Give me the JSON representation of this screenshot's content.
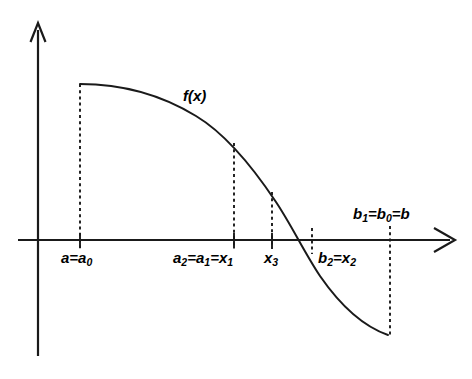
{
  "figure": {
    "type": "math-diagram",
    "background_color": "#ffffff",
    "stroke_color": "#1a1a1a"
  },
  "axes": {
    "x_axis_name": "x-axis",
    "y_axis_name": "y-axis",
    "origin_px": {
      "x": 38,
      "y": 240
    },
    "x_axis_end_px": 452,
    "y_axis_top_px": 22,
    "y_axis_bottom_px": 356,
    "has_x_arrow": true,
    "has_y_arrow": true
  },
  "curve": {
    "label": "f(x)",
    "label_position_px": {
      "x": 190,
      "y": 96
    },
    "start_px": {
      "x": 80,
      "y": 84
    },
    "end_px": {
      "x": 388,
      "y": 335
    },
    "zero_crossing_px": {
      "x": 296,
      "y": 240
    },
    "shape": "monotone decreasing sigmoid"
  },
  "markers": [
    {
      "id": "a",
      "label": "a=a",
      "sub": "0",
      "x_px": 80,
      "tick": true,
      "dashed_from_y_px": 84,
      "dashed_to_y_px": 248,
      "label_px": {
        "x": 62,
        "y": 250
      }
    },
    {
      "id": "a2a1x1",
      "label": "a",
      "sub": "2",
      "label2": "=a",
      "sub2": "1",
      "label3": "=x",
      "sub3": "1",
      "x_px": 234,
      "tick": true,
      "dashed_from_y_px": 143,
      "dashed_to_y_px": 248,
      "label_px": {
        "x": 176,
        "y": 250
      }
    },
    {
      "id": "x3",
      "label": "x",
      "sub": "3",
      "x_px": 272,
      "tick": true,
      "dashed_from_y_px": 192,
      "dashed_to_y_px": 248,
      "label_px": {
        "x": 264,
        "y": 250
      }
    },
    {
      "id": "b2x2",
      "label": "b",
      "sub": "2",
      "label2": "=x",
      "sub2": "2",
      "x_px": 312,
      "tick": false,
      "dashed_from_y_px": 230,
      "dashed_to_y_px": 252,
      "label_px": {
        "x": 318,
        "y": 250
      }
    },
    {
      "id": "b1b0b",
      "label": "b",
      "sub": "1",
      "label2": "=b",
      "sub2": "0",
      "label3": "=b",
      "x_px": 390,
      "tick": false,
      "dashed_from_y_px": 228,
      "dashed_to_y_px": 335,
      "label_px": {
        "x": 352,
        "y": 206
      }
    }
  ],
  "labels": {
    "fx": "f(x)",
    "a_label": "a=a",
    "a_sub": "0",
    "a2": "a",
    "a2_sub": "2",
    "a1": "=a",
    "a1_sub": "1",
    "x1": "=x",
    "x1_sub": "1",
    "x3": "x",
    "x3_sub": "3",
    "b2": "b",
    "b2_sub": "2",
    "x2": "=x",
    "x2_sub": "2",
    "b1": "b",
    "b1_sub": "1",
    "b0": "=b",
    "b0_sub": "0",
    "b": "=b"
  }
}
